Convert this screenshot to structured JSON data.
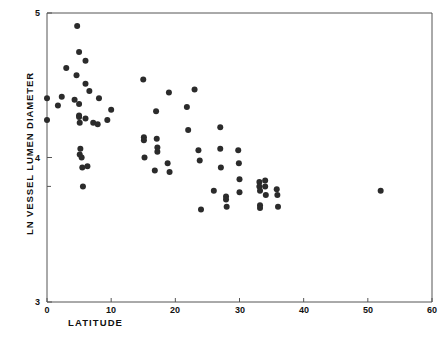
{
  "chart_data": {
    "type": "scatter",
    "title": "",
    "xlabel": "LATITUDE",
    "ylabel": "LN VESSEL LUMEN DIAMETER",
    "xlim": [
      0,
      60
    ],
    "ylim": [
      3,
      5
    ],
    "xticks": [
      0,
      10,
      20,
      30,
      40,
      50,
      60
    ],
    "xtick_labels": [
      "0",
      "10",
      "20",
      "30",
      "40",
      "50",
      "60"
    ],
    "yticks": [
      3,
      4,
      5
    ],
    "ytick_labels": [
      "3",
      "4",
      "5"
    ],
    "y_minor_ticks": [
      3.8
    ],
    "grid": false,
    "legend": false,
    "marker": "filled-circle",
    "marker_color": "#2b2b2b",
    "marker_size_px": 4.2,
    "axis_color": "#555555",
    "background": "#ffffff",
    "n_points": 79,
    "points": [
      [
        0.0,
        4.41
      ],
      [
        0.0,
        4.26
      ],
      [
        1.7,
        4.36
      ],
      [
        2.3,
        4.42
      ],
      [
        3.0,
        4.62
      ],
      [
        4.3,
        4.4
      ],
      [
        4.6,
        4.57
      ],
      [
        4.7,
        4.91
      ],
      [
        5.0,
        4.73
      ],
      [
        5.0,
        4.37
      ],
      [
        5.0,
        4.29
      ],
      [
        5.0,
        4.28
      ],
      [
        5.1,
        4.24
      ],
      [
        5.1,
        4.02
      ],
      [
        5.2,
        4.06
      ],
      [
        5.4,
        4.0
      ],
      [
        5.5,
        3.93
      ],
      [
        5.6,
        3.8
      ],
      [
        6.0,
        4.67
      ],
      [
        6.0,
        4.51
      ],
      [
        6.0,
        4.27
      ],
      [
        6.3,
        3.94
      ],
      [
        6.6,
        4.46
      ],
      [
        7.2,
        4.24
      ],
      [
        7.9,
        4.23
      ],
      [
        8.1,
        4.41
      ],
      [
        9.4,
        4.26
      ],
      [
        10.0,
        4.33
      ],
      [
        15.0,
        4.54
      ],
      [
        15.1,
        4.14
      ],
      [
        15.1,
        4.12
      ],
      [
        15.2,
        4.0
      ],
      [
        16.8,
        3.91
      ],
      [
        17.0,
        4.32
      ],
      [
        17.1,
        4.13
      ],
      [
        17.2,
        4.07
      ],
      [
        17.2,
        4.04
      ],
      [
        18.8,
        3.96
      ],
      [
        19.0,
        4.45
      ],
      [
        19.1,
        3.9
      ],
      [
        21.8,
        4.35
      ],
      [
        22.0,
        4.19
      ],
      [
        23.0,
        4.47
      ],
      [
        23.6,
        4.05
      ],
      [
        23.8,
        3.98
      ],
      [
        24.0,
        3.64
      ],
      [
        26.0,
        3.77
      ],
      [
        27.0,
        4.21
      ],
      [
        27.0,
        4.06
      ],
      [
        27.1,
        3.93
      ],
      [
        27.9,
        3.73
      ],
      [
        27.9,
        3.71
      ],
      [
        28.0,
        3.66
      ],
      [
        29.8,
        4.05
      ],
      [
        29.9,
        3.96
      ],
      [
        30.0,
        3.85
      ],
      [
        30.0,
        3.76
      ],
      [
        33.1,
        3.83
      ],
      [
        33.1,
        3.8
      ],
      [
        33.2,
        3.77
      ],
      [
        33.2,
        3.67
      ],
      [
        33.2,
        3.65
      ],
      [
        34.0,
        3.84
      ],
      [
        34.0,
        3.8
      ],
      [
        34.1,
        3.74
      ],
      [
        35.8,
        3.78
      ],
      [
        35.9,
        3.74
      ],
      [
        36.0,
        3.66
      ],
      [
        52.0,
        3.77
      ]
    ]
  },
  "axes": {
    "x_axis_name": "latitude-axis",
    "y_axis_name": "ln-vessel-lumen-diameter-axis"
  }
}
